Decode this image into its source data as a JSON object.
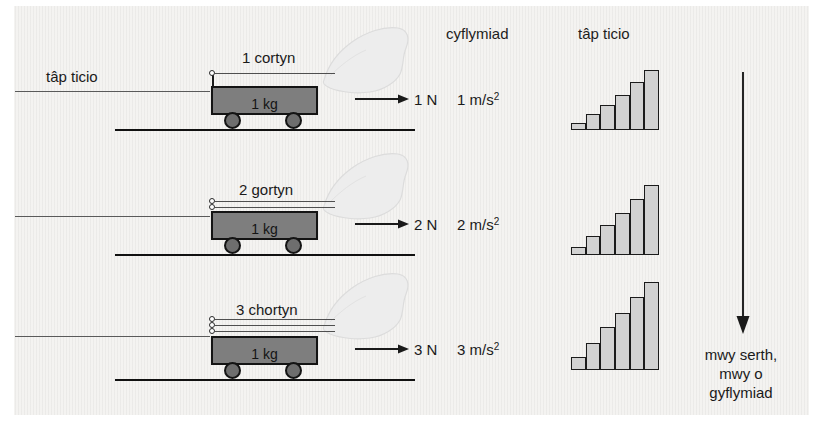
{
  "figure": {
    "background_color": "#f4f3f1",
    "ink_color": "#1a1a1a",
    "cart_fill_color": "#7e7e7e",
    "bar_fill_color": "#d2d2d2"
  },
  "headers": {
    "acceleration": "cyflymiad",
    "ticker_tape": "tâp ticio"
  },
  "left_label": {
    "ticker_tape": "tâp ticio"
  },
  "rows": [
    {
      "cord_label": "1 cortyn",
      "cord_count": 1,
      "mass_label": "1 kg",
      "force_label": "1 N",
      "acceleration_value": "1 m/s",
      "acceleration_exponent": "2"
    },
    {
      "cord_label": "2 gortyn",
      "cord_count": 2,
      "mass_label": "1 kg",
      "force_label": "2 N",
      "acceleration_value": "2 m/s",
      "acceleration_exponent": "2"
    },
    {
      "cord_label": "3 chortyn",
      "cord_count": 3,
      "mass_label": "1 kg",
      "force_label": "3 N",
      "acceleration_value": "3 m/s",
      "acceleration_exponent": "2"
    }
  ],
  "caption": {
    "line1": "mwy serth,",
    "line2": "mwy o",
    "line3": "gyflymiad"
  },
  "chart_data": [
    {
      "type": "bar",
      "title": "tâp ticio",
      "row": "1 N",
      "categories": [
        "1",
        "2",
        "3",
        "4",
        "5",
        "6"
      ],
      "values": [
        8,
        17,
        27,
        38,
        51,
        64
      ],
      "ylim": [
        0,
        90
      ],
      "grid": false,
      "xlabel": "",
      "ylabel": ""
    },
    {
      "type": "bar",
      "title": "tâp ticio",
      "row": "2 N",
      "categories": [
        "1",
        "2",
        "3",
        "4",
        "5",
        "6"
      ],
      "values": [
        9,
        20,
        32,
        45,
        60,
        75
      ],
      "ylim": [
        0,
        90
      ],
      "grid": false,
      "xlabel": "",
      "ylabel": ""
    },
    {
      "type": "bar",
      "title": "tâp ticio",
      "row": "3 N",
      "categories": [
        "1",
        "2",
        "3",
        "4",
        "5",
        "6"
      ],
      "values": [
        13,
        27,
        43,
        58,
        74,
        89
      ],
      "ylim": [
        0,
        90
      ],
      "grid": false,
      "xlabel": "",
      "ylabel": ""
    }
  ]
}
